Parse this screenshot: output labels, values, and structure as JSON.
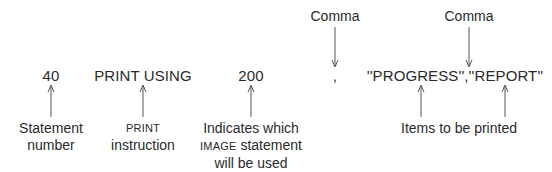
{
  "diagram": {
    "statement": {
      "line_number": "40",
      "instruction": "PRINT USING",
      "image_ref": "200",
      "comma1": ",",
      "items": "''PROGRESS'',''REPORT''"
    },
    "top_labels": {
      "comma_left": "Comma",
      "comma_right": "Comma"
    },
    "bottom_labels": {
      "statement_number": {
        "line1": "Statement",
        "line2": "number"
      },
      "print_instruction": {
        "line1": "PRINT",
        "line2": "instruction"
      },
      "image_indicator": {
        "line1": "Indicates which",
        "line2_sc": "IMAGE",
        "line2_rest": " statement",
        "line3": "will be used"
      },
      "items_label": "Items to be printed"
    },
    "colors": {
      "text": "#2a2a2a",
      "arrow": "#555555",
      "background": "#ffffff"
    }
  }
}
